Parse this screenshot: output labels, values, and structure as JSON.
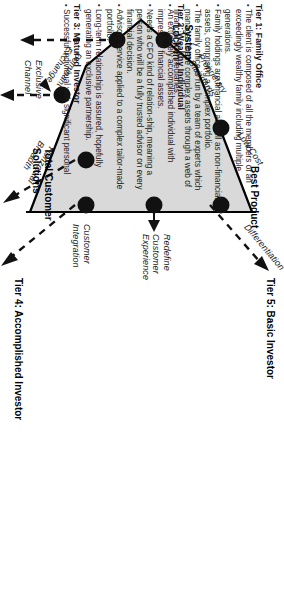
{
  "diagram": {
    "title_hidden": "",
    "shape": {
      "fill": "#d9d9d9",
      "stroke": "#000000",
      "dot_color": "#111111"
    },
    "vertex_labels": [
      {
        "name": "system-lock-in",
        "text": "System\nLock-In"
      },
      {
        "name": "best-product",
        "text": "Best Product"
      },
      {
        "name": "total-customer-solutions",
        "text": "Total Customer\nSolutions"
      }
    ],
    "edge_labels": [
      {
        "name": "proprietary-standards",
        "text": "Proprietary\nStandards"
      },
      {
        "name": "low-cost",
        "text": "Low Cost"
      },
      {
        "name": "differentiation",
        "text": "Differentiation"
      },
      {
        "name": "redefine-customer-experience",
        "text": "Redefine\nCustomer\nExperience"
      },
      {
        "name": "customer-integration",
        "text": "Customer\nIntegration"
      },
      {
        "name": "horizontal-breadth",
        "text": "Horizontal\nBreadth"
      },
      {
        "name": "exclusive-channel",
        "text": "Exclusive\nChannel"
      },
      {
        "name": "dominant-exchange",
        "text": "Dominant\nExchange"
      }
    ],
    "tier_labels": [
      {
        "name": "tier-4-accomplished-investor",
        "text": "Tier 4:  Accomplished Investor"
      },
      {
        "name": "tier-5-basic-investor",
        "text": "Tier 5:  Basic Investor"
      }
    ]
  },
  "tiers": [
    {
      "name": "tier-1-family-office",
      "heading": "Tier 1:  Family Office",
      "bullets": [
        "The client is composed of all the members of an exceedingly wealthy family including multiple generations.",
        "Family holdings are financial as well as non-financial assets, comprising a complex portfolio.",
        "The family office is run by a team of experts which manages these complex assets through a web of financial intermediaries."
      ]
    },
    {
      "name": "tier-2-wealthy-individual",
      "heading": "Tier 2:  Wealthy Individual",
      "bullets": [
        "An extremely accomplished individual with impressive financial assets.",
        "Needs a CFO kind of relation-ship, meaning a person who will be a fully trusted advisor on every financial decision.",
        "Advisory service applied to a complex tailor-made portfolio.",
        "Long-term relationship is assured, hopefully generating an exclusive partnership."
      ]
    },
    {
      "name": "tier-3-matured-investor",
      "heading": "Tier 3:  Matured Investor",
      "bullets": [
        "Successful individual with significant personal"
      ]
    }
  ]
}
